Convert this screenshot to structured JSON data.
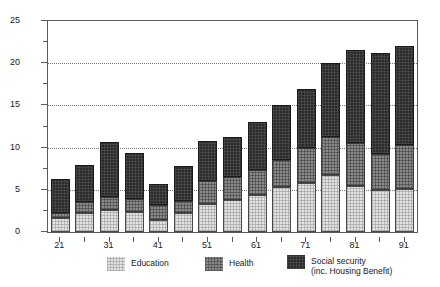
{
  "chart_data": {
    "type": "bar",
    "subtype": "stacked-vertical",
    "title": "",
    "subtitle": "",
    "xlabel": "",
    "ylabel": "",
    "ylim": [
      0,
      25
    ],
    "yticks": [
      0,
      5,
      10,
      15,
      20,
      25
    ],
    "ytick_labels": [
      "0",
      "5",
      "10",
      "15",
      "20",
      "25"
    ],
    "yminor_ticks": [
      2.5,
      7.5,
      12.5,
      17.5,
      22.5
    ],
    "grid": "horizontal-dotted",
    "legend_position": "bottom-center",
    "categories": [
      "21",
      "26",
      "31",
      "36",
      "41",
      "46",
      "51",
      "56",
      "61",
      "66",
      "71",
      "76",
      "81",
      "86",
      "91"
    ],
    "xtick_labels": [
      "21",
      "31",
      "41",
      "51",
      "61",
      "71",
      "81",
      "91"
    ],
    "xtick_categories": [
      "21",
      "31",
      "41",
      "51",
      "61",
      "71",
      "81",
      "91"
    ],
    "series": [
      {
        "name": "Education",
        "color": "#e3e3e3",
        "values": [
          1.7,
          2.2,
          2.6,
          2.4,
          1.4,
          2.2,
          3.3,
          3.8,
          4.4,
          5.3,
          5.8,
          6.7,
          5.4,
          5.0,
          5.1
        ]
      },
      {
        "name": "Health",
        "color": "#8a8a8a",
        "values": [
          0.5,
          1.4,
          1.6,
          1.5,
          1.8,
          1.5,
          2.8,
          2.7,
          2.9,
          3.2,
          4.2,
          4.5,
          5.2,
          4.3,
          5.2
        ]
      },
      {
        "name": "Social security (inc. Housing Benefit)",
        "color": "#2b2b2b",
        "values": [
          4.1,
          4.4,
          6.5,
          5.5,
          2.5,
          4.1,
          4.7,
          4.8,
          5.7,
          6.5,
          7.0,
          8.8,
          11.0,
          11.9,
          11.7
        ]
      }
    ],
    "totals": [
      6.3,
      8.0,
      10.7,
      9.4,
      5.7,
      7.8,
      10.8,
      11.3,
      13.0,
      15.0,
      17.0,
      20.0,
      21.6,
      21.2,
      22.0
    ]
  },
  "legend": {
    "items": [
      {
        "label": "Education",
        "swatch": "education-swatch"
      },
      {
        "label": "Health",
        "swatch": "health-swatch"
      },
      {
        "label": "Social security\n(inc. Housing Benefit)",
        "swatch": "social-security-swatch"
      }
    ]
  },
  "colors": {
    "education": "#e3e3e3",
    "health": "#8a8a8a",
    "social_security": "#2b2b2b",
    "axis": "#5a5a5a",
    "grid": "#7a7a7a",
    "background": "#ffffff"
  }
}
